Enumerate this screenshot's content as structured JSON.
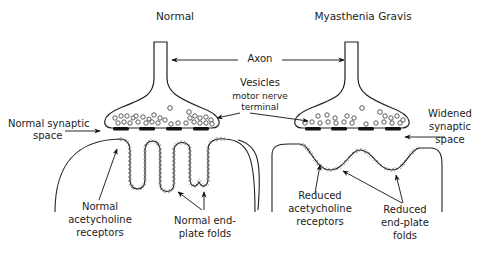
{
  "diagram": {
    "panels": [
      {
        "id": "normal",
        "title": "Normal",
        "labels": {
          "synaptic_space": [
            "Normal synaptic",
            "space"
          ],
          "receptors": [
            "Normal",
            "acetycholine",
            "receptors"
          ],
          "folds": [
            "Normal end-",
            "plate folds"
          ]
        }
      },
      {
        "id": "myasthenia",
        "title": "Myasthenia Gravis",
        "labels": {
          "synaptic_space": [
            "Widened",
            "synaptic",
            "space"
          ],
          "receptors": [
            "Reduced",
            "acetycholine",
            "receptors"
          ],
          "folds": [
            "Reduced",
            "end-plate",
            "folds"
          ]
        }
      }
    ],
    "shared_labels": {
      "axon": "Axon",
      "vesicles": "Vesicles",
      "terminal": [
        "motor nerve",
        "terminal"
      ]
    },
    "colors": {
      "line": "#222222",
      "background": "#ffffff"
    }
  }
}
